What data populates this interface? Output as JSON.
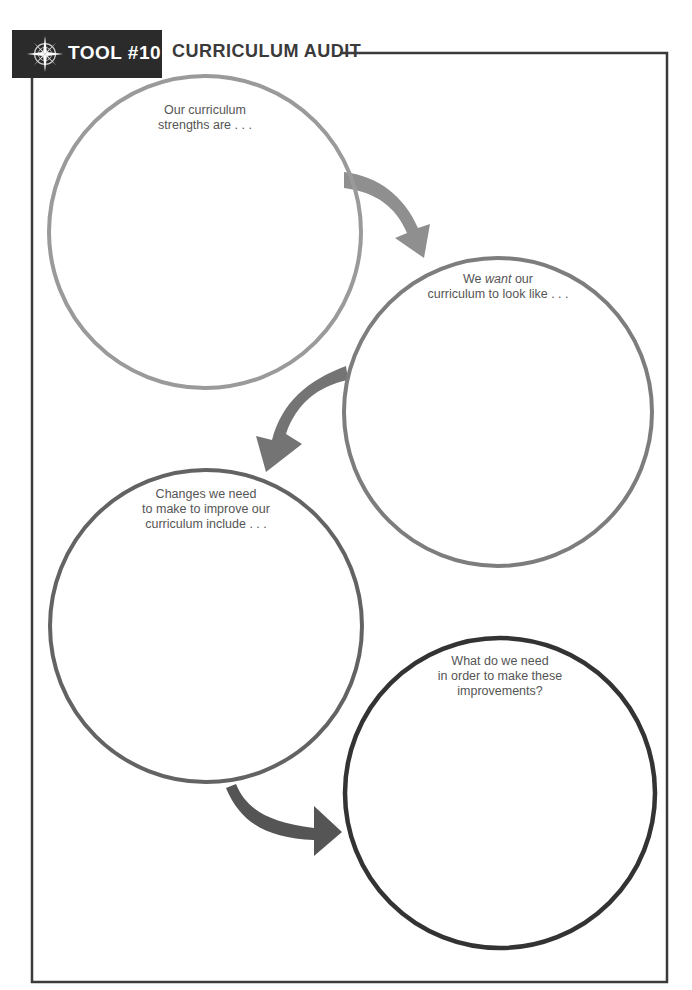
{
  "header": {
    "icon": "compass-rose-icon",
    "tool_label": "TOOL #10",
    "title": "CURRICULUM AUDIT"
  },
  "colors": {
    "header_bg": "#2b2b2b",
    "frame": "#3a3a3a",
    "circle_1": "#9a9a9a",
    "circle_2": "#7d7d7d",
    "circle_3": "#636363",
    "circle_4": "#333333",
    "arrow_1": "#8f8f8f",
    "arrow_2": "#747474",
    "arrow_3": "#555555"
  },
  "circles": [
    {
      "id": 1,
      "lines": [
        "Our curriculum",
        "strengths are . . ."
      ]
    },
    {
      "id": 2,
      "line1_pre": "We ",
      "line1_em": "want",
      "line1_post": " our",
      "line2": "curriculum to look like . . ."
    },
    {
      "id": 3,
      "lines": [
        "Changes we need",
        "to make to improve our",
        "curriculum include . . ."
      ]
    },
    {
      "id": 4,
      "lines": [
        "What do we need",
        "in order to make these",
        "improvements?"
      ]
    }
  ]
}
